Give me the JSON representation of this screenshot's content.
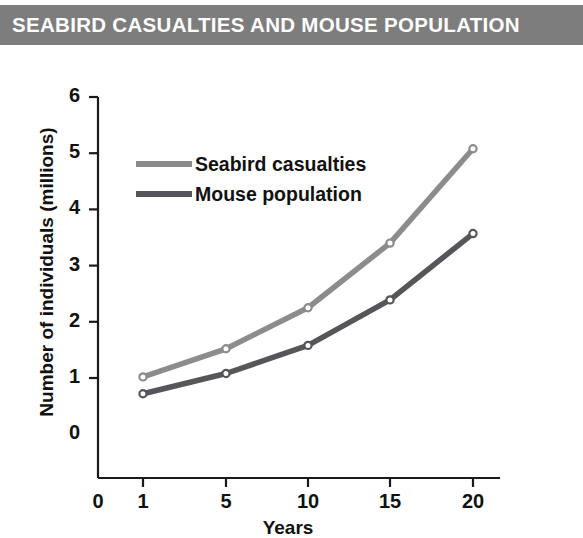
{
  "title": "SEABIRD CASUALTIES AND MOUSE POPULATION",
  "colors": {
    "banner": "#7d7d7d",
    "banner_text": "#ffffff",
    "seabird": "#8c8c8c",
    "mouse": "#55555a",
    "axis": "#1a1a1a",
    "text": "#111111",
    "background": "#ffffff"
  },
  "legend": {
    "position": "top-left-inside",
    "items": [
      {
        "label": "Seabird casualties",
        "color": "#8c8c8c"
      },
      {
        "label": "Mouse population",
        "color": "#55555a"
      }
    ]
  },
  "axes": {
    "y_title": "Number of individuals (millions)",
    "x_title": "Years",
    "y_ticks": [
      "0",
      "1",
      "2",
      "3",
      "4",
      "5",
      "6"
    ],
    "x_ticks": [
      "0",
      "1",
      "5",
      "10",
      "15",
      "20"
    ]
  },
  "chart_data": {
    "type": "line",
    "title": "SEABIRD CASUALTIES AND MOUSE POPULATION",
    "xlabel": "Years",
    "ylabel": "Number of individuals (millions)",
    "x": [
      1,
      5,
      10,
      15,
      20
    ],
    "xtick_labels": [
      "0",
      "1",
      "5",
      "10",
      "15",
      "20"
    ],
    "xtick_values": [
      0,
      1,
      5,
      10,
      15,
      20
    ],
    "ytick_labels": [
      "0",
      "1",
      "2",
      "3",
      "4",
      "5",
      "6"
    ],
    "ylim": [
      0,
      6
    ],
    "grid": false,
    "markers": "open-circle",
    "series": [
      {
        "name": "Seabird casualties",
        "color": "#8c8c8c",
        "values": [
          1.02,
          1.52,
          2.25,
          3.4,
          5.08
        ]
      },
      {
        "name": "Mouse population",
        "color": "#55555a",
        "values": [
          0.72,
          1.08,
          1.58,
          2.39,
          3.57
        ]
      }
    ]
  }
}
